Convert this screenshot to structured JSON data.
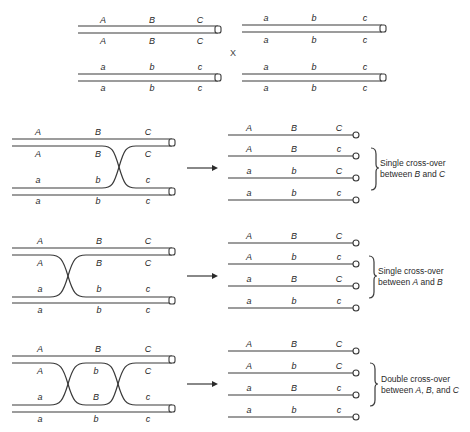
{
  "diagram": {
    "cross_symbol": "X",
    "parents": {
      "left": {
        "upper_pair": {
          "top": [
            "A",
            "B",
            "C"
          ],
          "bottom": [
            "A",
            "B",
            "C"
          ]
        },
        "lower_pair": {
          "top": [
            "a",
            "b",
            "c"
          ],
          "bottom": [
            "a",
            "b",
            "c"
          ]
        }
      },
      "right": {
        "upper_pair": {
          "top": [
            "a",
            "b",
            "c"
          ],
          "bottom": [
            "a",
            "b",
            "c"
          ]
        },
        "lower_pair": {
          "top": [
            "a",
            "b",
            "c"
          ],
          "bottom": [
            "a",
            "b",
            "c"
          ]
        }
      }
    },
    "sections": [
      {
        "name": "single-crossover-B-C",
        "tetrad_labels": {
          "row1": [
            "A",
            "B",
            "C"
          ],
          "row2": [
            "A",
            "B",
            "C"
          ],
          "row3": [
            "a",
            "b",
            "c"
          ],
          "row4": [
            "a",
            "b",
            "c"
          ]
        },
        "products": [
          [
            "A",
            "B",
            "C"
          ],
          [
            "A",
            "B",
            "c"
          ],
          [
            "a",
            "b",
            "C"
          ],
          [
            "a",
            "b",
            "c"
          ]
        ],
        "note_line1": "Single cross-over",
        "note_line2_prefix": "between ",
        "note_gene1": "B",
        "note_mid": " and ",
        "note_gene2": "C"
      },
      {
        "name": "single-crossover-A-B",
        "tetrad_labels": {
          "row1": [
            "A",
            "B",
            "C"
          ],
          "row2": [
            "A",
            "B",
            "C"
          ],
          "row3": [
            "a",
            "b",
            "c"
          ],
          "row4": [
            "a",
            "b",
            "c"
          ]
        },
        "products": [
          [
            "A",
            "B",
            "C"
          ],
          [
            "A",
            "b",
            "c"
          ],
          [
            "a",
            "B",
            "C"
          ],
          [
            "a",
            "b",
            "c"
          ]
        ],
        "note_line1": "Single cross-over",
        "note_line2_prefix": "between ",
        "note_gene1": "A",
        "note_mid": " and ",
        "note_gene2": "B"
      },
      {
        "name": "double-crossover-A-B-C",
        "tetrad_labels": {
          "row1": [
            "A",
            "B",
            "C"
          ],
          "row2": [
            "A",
            "b",
            "C"
          ],
          "row3": [
            "a",
            "B",
            "c"
          ],
          "row4": [
            "a",
            "b",
            "c"
          ]
        },
        "products": [
          [
            "A",
            "B",
            "C"
          ],
          [
            "A",
            "b",
            "C"
          ],
          [
            "a",
            "B",
            "c"
          ],
          [
            "a",
            "b",
            "c"
          ]
        ],
        "note_line1": "Double cross-over",
        "note_line2_prefix": "between ",
        "note_gene1": "A",
        "note_sep": ", ",
        "note_gene2": "B",
        "note_mid": ", and ",
        "note_gene3": "C"
      }
    ],
    "colors": {
      "ink": "#2a2a2a",
      "background": "#ffffff"
    }
  }
}
